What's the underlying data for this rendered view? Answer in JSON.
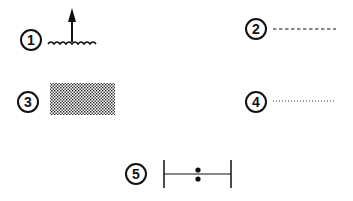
{
  "legend": {
    "items": [
      {
        "number": "1",
        "symbol": "arrow-above-water-icon"
      },
      {
        "number": "2",
        "symbol": "dashed-line-icon"
      },
      {
        "number": "3",
        "symbol": "stippled-area-icon"
      },
      {
        "number": "4",
        "symbol": "dotted-line-icon"
      },
      {
        "number": "5",
        "symbol": "bracketed-range-with-colon-icon"
      }
    ]
  },
  "colors": {
    "ink": "#111111",
    "background": "#ffffff"
  }
}
